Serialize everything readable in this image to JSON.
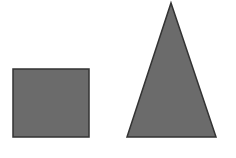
{
  "diagram": {
    "background": "#ffffff",
    "shapes": [
      {
        "type": "square",
        "x": 13,
        "y": 69,
        "width": 76,
        "height": 68,
        "fill": "#6b6b6b",
        "stroke": "#333333"
      },
      {
        "type": "triangle",
        "points": "171,3 216,137 127,137",
        "fill": "#6b6b6b",
        "stroke": "#333333"
      }
    ]
  }
}
